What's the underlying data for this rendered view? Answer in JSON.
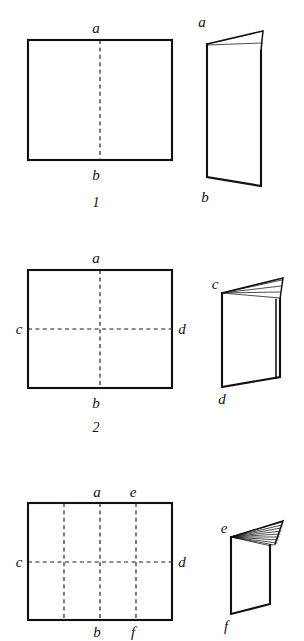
{
  "page": {
    "background_color": "#ffffff",
    "ink_color": "#111111",
    "width": 304,
    "height": 641
  },
  "figures": [
    {
      "number": "1",
      "flat_sheet": {
        "shape": "rectangle",
        "creases": [
          "vertical center fold"
        ],
        "crease_count": 1,
        "vertex_labels": {
          "top": "a",
          "bottom": "b"
        }
      },
      "folded_sheet": {
        "fold_count": 1,
        "fan_line_count": 1,
        "vertex_labels": {
          "top": "a",
          "bottom": "b"
        }
      }
    },
    {
      "number": "2",
      "flat_sheet": {
        "shape": "rectangle",
        "creases": [
          "vertical center fold",
          "horizontal center fold"
        ],
        "crease_count": 2,
        "vertex_labels": {
          "top": "a",
          "bottom": "b",
          "left": "c",
          "right": "d"
        }
      },
      "folded_sheet": {
        "fold_count": 2,
        "fan_line_count": 4,
        "vertex_labels": {
          "top": "c",
          "bottom": "d"
        }
      }
    },
    {
      "number": "3",
      "flat_sheet": {
        "shape": "rectangle",
        "creases": [
          "vertical quarter fold left",
          "vertical center fold",
          "vertical quarter fold right",
          "horizontal center fold"
        ],
        "crease_count": 4,
        "vertex_labels": {
          "top_center": "a",
          "top_right_quarter": "e",
          "bottom_center": "b",
          "bottom_right_quarter": "f",
          "left": "c",
          "right": "d"
        }
      },
      "folded_sheet": {
        "fold_count": 3,
        "fan_line_count": 10,
        "vertex_labels": {
          "top": "e",
          "bottom": "f"
        }
      }
    }
  ],
  "labels": {
    "a": "a",
    "b": "b",
    "c": "c",
    "d": "d",
    "e": "e",
    "f": "f",
    "fig1": "1",
    "fig2": "2",
    "fig3": "3"
  }
}
